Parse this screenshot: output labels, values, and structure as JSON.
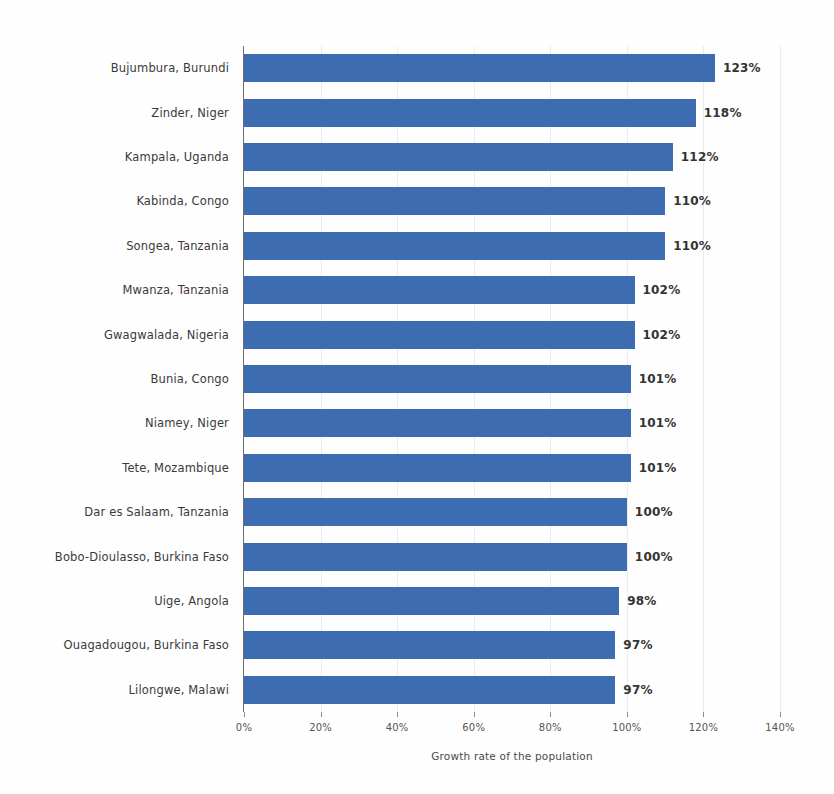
{
  "chart_data": {
    "type": "bar",
    "orientation": "horizontal",
    "title": "",
    "xlabel": "Growth rate of the population",
    "ylabel": "",
    "xlim": [
      0,
      140
    ],
    "x_tick_labels": [
      "0%",
      "20%",
      "40%",
      "60%",
      "80%",
      "100%",
      "120%",
      "140%"
    ],
    "x_ticks": [
      0,
      20,
      40,
      60,
      80,
      100,
      120,
      140
    ],
    "grid": true,
    "legend": false,
    "bar_color": "#3d6cb0",
    "value_suffix": "%",
    "categories": [
      "Bujumbura, Burundi",
      "Zinder, Niger",
      "Kampala, Uganda",
      "Kabinda, Congo",
      "Songea, Tanzania",
      "Mwanza, Tanzania",
      "Gwagwalada, Nigeria",
      "Bunia, Congo",
      "Niamey, Niger",
      "Tete, Mozambique",
      "Dar es Salaam, Tanzania",
      "Bobo-Dioulasso, Burkina Faso",
      "Uige, Angola",
      "Ouagadougou, Burkina Faso",
      "Lilongwe, Malawi"
    ],
    "values": [
      123,
      118,
      112,
      110,
      110,
      102,
      102,
      101,
      101,
      101,
      100,
      100,
      98,
      97,
      97
    ],
    "value_labels": [
      "123%",
      "118%",
      "112%",
      "110%",
      "110%",
      "102%",
      "102%",
      "101%",
      "101%",
      "101%",
      "100%",
      "100%",
      "98%",
      "97%",
      "97%"
    ]
  }
}
